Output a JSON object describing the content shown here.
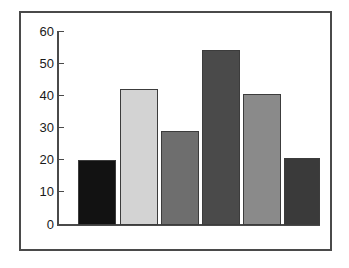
{
  "figure": {
    "kind": "bar-chart-figure",
    "frame_color": "#4a4a4a",
    "background_color": "#ffffff"
  },
  "chart_data": {
    "type": "bar",
    "title": "",
    "subtitle": "",
    "xlabel": "",
    "ylabel": "",
    "categories": [
      "1",
      "2",
      "3",
      "4",
      "5",
      "6"
    ],
    "values": [
      20,
      42,
      29,
      54,
      40.5,
      20.5
    ],
    "bar_colors": [
      "#121212",
      "#d3d3d3",
      "#6e6e6e",
      "#4a4a4a",
      "#8a8a8a",
      "#3a3a3a"
    ],
    "bar_edge_color": "#3c3c3c",
    "ylim": [
      0,
      60
    ],
    "yticks": [
      0,
      10,
      20,
      30,
      40,
      50,
      60
    ],
    "ytick_labels": [
      "0",
      "10",
      "20",
      "30",
      "40",
      "50",
      "60"
    ],
    "xticks": [],
    "xtick_labels": [],
    "grid": false,
    "legend": null,
    "legend_position": "none",
    "annotations": []
  },
  "axis": {
    "y_axis_name": "y-axis",
    "x_axis_name": "x-axis",
    "axis_color": "#4a4a4a"
  }
}
